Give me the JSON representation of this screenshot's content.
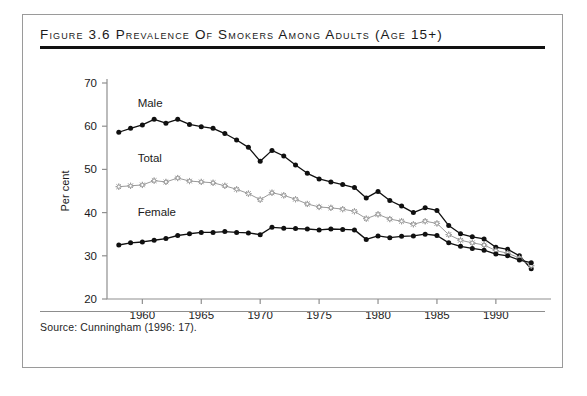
{
  "figure": {
    "title": "Figure 3.6 Prevalence of Smokers among Adults (age 15+)",
    "source": "Source:  Cunningham (1996: 17)."
  },
  "chart_data": {
    "type": "line",
    "title": "Figure 3.6 Prevalence of Smokers among Adults (age 15+)",
    "xlabel": "",
    "ylabel": "Per cent",
    "xlim": [
      1957,
      1994
    ],
    "ylim": [
      20,
      70
    ],
    "ytick_labels": [
      "20",
      "30",
      "40",
      "50",
      "60",
      "70"
    ],
    "yticks": [
      20,
      30,
      40,
      50,
      60,
      70
    ],
    "xtick_labels": [
      "1960",
      "1965",
      "1970",
      "1975",
      "1980",
      "1985",
      "1990"
    ],
    "xticks": [
      1960,
      1965,
      1970,
      1975,
      1980,
      1985,
      1990
    ],
    "grid": false,
    "legend_position": "inline-labels",
    "x": [
      1958,
      1959,
      1960,
      1961,
      1962,
      1963,
      1964,
      1965,
      1966,
      1967,
      1968,
      1969,
      1970,
      1971,
      1972,
      1973,
      1974,
      1975,
      1976,
      1977,
      1978,
      1979,
      1980,
      1981,
      1982,
      1983,
      1984,
      1985,
      1986,
      1987,
      1988,
      1989,
      1990,
      1991,
      1992,
      1993
    ],
    "series": [
      {
        "name": "Male",
        "marker": "filled-circle",
        "color": "#101010",
        "values": [
          58.6,
          59.5,
          60.3,
          61.6,
          60.7,
          61.6,
          60.4,
          59.9,
          59.5,
          58.3,
          56.8,
          55.1,
          51.9,
          54.4,
          53.1,
          51.0,
          49.1,
          47.8,
          47.1,
          46.5,
          45.8,
          43.4,
          44.9,
          42.8,
          41.5,
          40.0,
          41.1,
          40.5,
          37.0,
          35.1,
          34.4,
          33.9,
          32.0,
          31.5,
          30.0,
          27.0
        ]
      },
      {
        "name": "Total",
        "marker": "open-star",
        "color": "#9a9a9a",
        "values": [
          46.0,
          46.2,
          46.4,
          47.4,
          47.1,
          48.0,
          47.3,
          47.1,
          46.9,
          46.2,
          45.4,
          44.4,
          43.0,
          44.6,
          44.0,
          43.1,
          42.0,
          41.3,
          41.1,
          40.8,
          40.3,
          38.6,
          39.6,
          38.5,
          38.0,
          37.3,
          38.0,
          37.5,
          34.9,
          33.6,
          33.0,
          32.5,
          31.2,
          30.6,
          29.5,
          27.7
        ]
      },
      {
        "name": "Female",
        "marker": "filled-circle",
        "color": "#101010",
        "values": [
          32.5,
          33.0,
          33.2,
          33.6,
          34.0,
          34.7,
          35.1,
          35.4,
          35.4,
          35.6,
          35.4,
          35.3,
          34.9,
          36.6,
          36.4,
          36.3,
          36.2,
          36.0,
          36.2,
          36.1,
          36.0,
          33.8,
          34.6,
          34.2,
          34.5,
          34.6,
          35.0,
          34.7,
          33.0,
          32.2,
          31.7,
          31.3,
          30.4,
          30.0,
          29.0,
          28.4
        ]
      }
    ],
    "inline_labels": [
      {
        "text": "Male",
        "x": 1959.6,
        "y": 64.5
      },
      {
        "text": "Total",
        "x": 1959.6,
        "y": 51.6
      },
      {
        "text": "Female",
        "x": 1959.6,
        "y": 39.3
      }
    ]
  }
}
